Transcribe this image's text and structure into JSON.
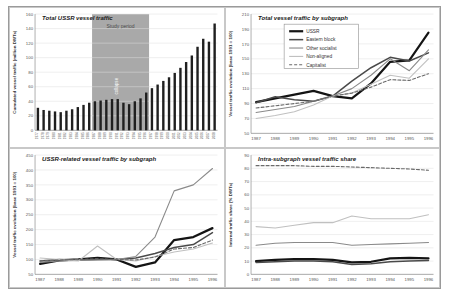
{
  "figure": {
    "background": "#ffffff",
    "frame_border": "#9a9a9a",
    "cell_border": "#c8c8c8",
    "grid_color": "#dedede",
    "axis_color": "#8f8f8f",
    "tick_color": "#555555",
    "title_color": "#1a1a1a"
  },
  "chart_data": [
    {
      "id": "total-ussr-vessel-traffic",
      "position": "top-left",
      "type": "bar",
      "title": "Total USSR vessel traffic",
      "ylabel": "Cumulated vessel traffic (million DWTs)",
      "ylim": [
        0,
        160
      ],
      "ytick_step": 20,
      "bar_color": "#1f1f1f",
      "categories": [
        1977,
        1978,
        1979,
        1980,
        1981,
        1982,
        1983,
        1984,
        1985,
        1986,
        1987,
        1988,
        1989,
        1990,
        1991,
        1992,
        1993,
        1994,
        1995,
        1996,
        1997,
        1998,
        1999,
        2000,
        2001,
        2002,
        2003,
        2004,
        2005,
        2006,
        2007,
        2008
      ],
      "values": [
        31,
        28,
        27,
        26,
        25,
        27,
        29,
        32,
        35,
        38,
        40,
        41,
        42,
        43,
        43,
        38,
        36,
        40,
        44,
        52,
        58,
        63,
        68,
        73,
        79,
        86,
        94,
        103,
        115,
        126,
        122,
        147
      ],
      "band": {
        "from": 1987,
        "to": 1996,
        "color": "#a9a9a9",
        "label": "Study period",
        "label_color": "#4a4a4a",
        "vertical_label": "collapse",
        "vertical_label_x": 1991,
        "vertical_label_color": "#ffffff"
      }
    },
    {
      "id": "total-vessel-traffic-by-subgraph",
      "position": "top-right",
      "type": "line",
      "title": "Total vessel traffic by subgraph",
      "ylabel": "Vessel traffic evolution (base 1991 = 100)",
      "ylim": [
        50,
        210
      ],
      "ytick_step": 20,
      "legend": true,
      "x": [
        1987,
        1988,
        1989,
        1990,
        1991,
        1992,
        1993,
        1994,
        1995,
        1996
      ],
      "series": [
        {
          "name": "USSR",
          "color": "#141414",
          "width": 2.2,
          "dash": "",
          "values": [
            92,
            97,
            102,
            107,
            100,
            97,
            117,
            146,
            148,
            185
          ]
        },
        {
          "name": "Eastern block",
          "color": "#4a4a4a",
          "width": 1.5,
          "dash": "",
          "values": [
            91,
            99,
            95,
            93,
            100,
            120,
            138,
            152,
            147,
            158
          ]
        },
        {
          "name": "Other socialist",
          "color": "#8a8a8a",
          "width": 1.1,
          "dash": "",
          "values": [
            78,
            82,
            86,
            93,
            100,
            110,
            128,
            150,
            134,
            162
          ]
        },
        {
          "name": "Non-aligned",
          "color": "#c0c0c0",
          "width": 1.1,
          "dash": "",
          "values": [
            70,
            74,
            79,
            88,
            100,
            104,
            116,
            128,
            124,
            150
          ]
        },
        {
          "name": "Capitalist",
          "color": "#6a6a6a",
          "width": 1.1,
          "dash": "3,2",
          "values": [
            84,
            87,
            90,
            93,
            100,
            104,
            112,
            122,
            121,
            130
          ]
        }
      ]
    },
    {
      "id": "ussr-related-vessel-traffic-by-subgraph",
      "position": "bottom-left",
      "type": "line",
      "title": "USSR-related vessel traffic by subgraph",
      "ylabel": "Vessel traffic evolution (base 1991 = 100)",
      "ylim": [
        50,
        450
      ],
      "ytick_step": 50,
      "legend": false,
      "x": [
        1987,
        1988,
        1989,
        1990,
        1991,
        1992,
        1993,
        1994,
        1995,
        1996
      ],
      "series": [
        {
          "name": "USSR",
          "color": "#141414",
          "width": 2.2,
          "dash": "",
          "values": [
            85,
            97,
            100,
            105,
            100,
            75,
            90,
            165,
            175,
            205
          ]
        },
        {
          "name": "Eastern block",
          "color": "#4a4a4a",
          "width": 1.5,
          "dash": "",
          "values": [
            95,
            100,
            98,
            100,
            100,
            105,
            120,
            140,
            150,
            190
          ]
        },
        {
          "name": "Other socialist",
          "color": "#8a8a8a",
          "width": 1.1,
          "dash": "",
          "values": [
            90,
            95,
            97,
            98,
            100,
            110,
            175,
            330,
            350,
            405
          ]
        },
        {
          "name": "Non-aligned",
          "color": "#c0c0c0",
          "width": 1.1,
          "dash": "",
          "values": [
            105,
            100,
            95,
            145,
            100,
            95,
            110,
            125,
            135,
            155
          ]
        },
        {
          "name": "Capitalist",
          "color": "#6a6a6a",
          "width": 1.1,
          "dash": "3,2",
          "values": [
            95,
            98,
            100,
            102,
            100,
            98,
            108,
            135,
            140,
            165
          ]
        }
      ]
    },
    {
      "id": "intra-subgraph-vessel-traffic-share",
      "position": "bottom-right",
      "type": "line",
      "title": "Intra-subgraph vessel traffic share",
      "ylabel": "Internal traffic share (% DWTs)",
      "ylim": [
        0,
        90
      ],
      "ytick_step": 10,
      "legend": false,
      "x": [
        1987,
        1988,
        1989,
        1990,
        1991,
        1992,
        1993,
        1994,
        1995,
        1996
      ],
      "series": [
        {
          "name": "USSR",
          "color": "#141414",
          "width": 2.2,
          "dash": "",
          "values": [
            10,
            11,
            11.5,
            11.5,
            11,
            9,
            9.5,
            12,
            12.5,
            12
          ]
        },
        {
          "name": "Eastern block",
          "color": "#4a4a4a",
          "width": 1.5,
          "dash": "",
          "values": [
            9,
            9.5,
            10,
            10,
            9.5,
            7.5,
            8,
            9.5,
            10,
            10.5
          ]
        },
        {
          "name": "Other socialist",
          "color": "#8a8a8a",
          "width": 1.1,
          "dash": "",
          "values": [
            22,
            23.5,
            24,
            24,
            24,
            22,
            22.5,
            23,
            23.5,
            24
          ]
        },
        {
          "name": "Non-aligned",
          "color": "#c0c0c0",
          "width": 1.1,
          "dash": "",
          "values": [
            36,
            35,
            37,
            39,
            39,
            44,
            42,
            42,
            42,
            45
          ]
        },
        {
          "name": "Capitalist",
          "color": "#6a6a6a",
          "width": 1.1,
          "dash": "3,2",
          "values": [
            82,
            82,
            82,
            81.5,
            81.5,
            81,
            80.5,
            80,
            79.5,
            78.5
          ]
        }
      ]
    }
  ]
}
